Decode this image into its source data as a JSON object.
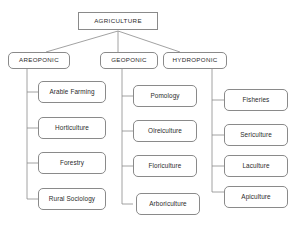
{
  "diagram": {
    "background_color": "#ffffff",
    "line_color": "#8a8a8a",
    "text_color": "#2b2b2b",
    "root": {
      "label": "AGRICULTURE"
    },
    "branches": [
      {
        "label": "AREOPONIC"
      },
      {
        "label": "GEOPONIC"
      },
      {
        "label": "HYDROPONIC"
      }
    ],
    "leaves": {
      "areoponic": [
        {
          "label": "Arable Farming"
        },
        {
          "label": "Horticulture"
        },
        {
          "label": "Forestry"
        },
        {
          "label": "Rural Sociology"
        }
      ],
      "geoponic": [
        {
          "label": "Pomology"
        },
        {
          "label": "Olreiculture"
        },
        {
          "label": "Floriculture"
        },
        {
          "label": "Arboriculture"
        }
      ],
      "hydroponic": [
        {
          "label": "Fisheries"
        },
        {
          "label": "Sericulture"
        },
        {
          "label": "Laculture"
        },
        {
          "label": "Apiculture"
        }
      ]
    }
  }
}
